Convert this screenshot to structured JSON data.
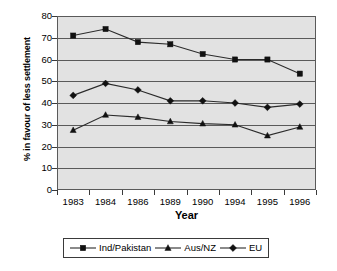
{
  "chart_data": {
    "type": "line",
    "title": "",
    "xlabel": "Year",
    "ylabel": "% in favour of less settlement",
    "categories": [
      "1983",
      "1984",
      "1986",
      "1989",
      "1990",
      "1994",
      "1995",
      "1996"
    ],
    "ylim": [
      0,
      80
    ],
    "yticks": [
      0,
      10,
      20,
      30,
      40,
      50,
      60,
      70,
      80
    ],
    "grid": true,
    "legend_position": "bottom",
    "series": [
      {
        "name": "Ind/Pakistan",
        "marker": "square",
        "values": [
          71,
          74,
          68,
          67,
          62.5,
          60,
          60,
          53.5
        ]
      },
      {
        "name": "Aus/NZ",
        "marker": "triangle",
        "values": [
          27.5,
          34.5,
          33.5,
          31.5,
          30.5,
          30,
          25,
          29
        ]
      },
      {
        "name": "EU",
        "marker": "diamond",
        "values": [
          43.5,
          49,
          46,
          41,
          41,
          40,
          38,
          39.5
        ]
      }
    ]
  },
  "axis": {
    "y_title": "% in favour of less settlement",
    "x_title": "Year",
    "y_labels": [
      "80",
      "70",
      "60",
      "50",
      "40",
      "30",
      "20",
      "10",
      "0"
    ],
    "x_labels": [
      "1983",
      "1984",
      "1986",
      "1989",
      "1990",
      "1994",
      "1995",
      "1996"
    ]
  },
  "legend": {
    "entries": [
      {
        "label": "Ind/Pakistan",
        "marker": "square"
      },
      {
        "label": "Aus/NZ",
        "marker": "triangle"
      },
      {
        "label": "EU",
        "marker": "diamond"
      }
    ]
  },
  "colors": {
    "plot_background": "#e2e2e2",
    "gridline": "#5a5a5a",
    "series": "#2b2b2b",
    "page_background": "#ffffff"
  }
}
